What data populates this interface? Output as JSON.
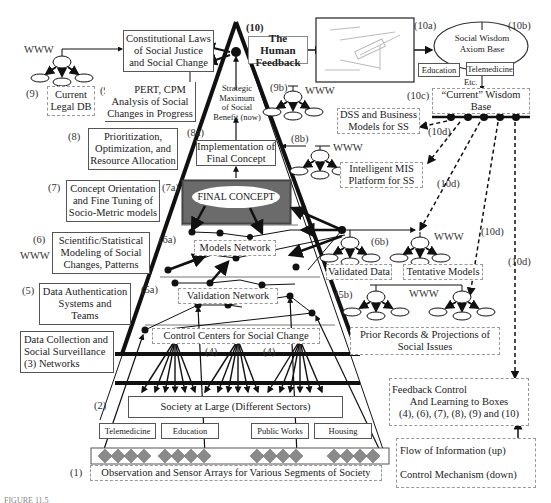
{
  "figure": {
    "caption": "FIGURE 11.5",
    "title": "The Human Feedback"
  },
  "pyramid": {
    "apex_number": "(10)",
    "strategic_maximum": [
      "Strategic",
      "Maximum",
      "of Social",
      "Benefit (now)"
    ],
    "implementation": [
      "Implementation of",
      "Final Concept"
    ],
    "final_concept": "FINAL CONCEPT",
    "models_network": "Models Network",
    "validation_network": "Validation Network",
    "control_centers": "Control Centers for Social Change",
    "society_at_large": "Society at Large (Different Sectors)",
    "sectors": [
      "Telemedicine",
      "Education",
      "Public Works",
      "Housing"
    ],
    "sensor_arrays": "Observation and Sensor Arrays for Various Segments of Society",
    "level_tags": {
      "8a": "(8a)",
      "7a": "(7a)",
      "6a": "(6a)",
      "5a": "(5a)",
      "4a": "(4)",
      "4b": "(4)"
    }
  },
  "left_boxes": {
    "constitutional": [
      "Constitutional Laws",
      "of Social Justice",
      "and Social Change"
    ],
    "pert": {
      "number": "(9a)",
      "lines": [
        "PERT, CPM",
        "Analysis of Social",
        "Changes in Progress"
      ]
    },
    "legal_db": {
      "number": "(9)",
      "lines": [
        "Current",
        "Legal DB"
      ]
    },
    "prioritization": {
      "number": "(8)",
      "lines": [
        "Prioritization,",
        "Optimization, and",
        "Resource Allocation"
      ]
    },
    "concept_orientation": {
      "number": "(7)",
      "lines": [
        "Concept Orientation",
        "and Fine Tuning of",
        "Socio-Metric models"
      ]
    },
    "scientific": {
      "number": "(6)",
      "lines": [
        "Scientific/Statistical",
        "Modeling of Social",
        "Changes, Patterns"
      ]
    },
    "data_authentication": {
      "number": "(5)",
      "lines": [
        "Data Authentication",
        "Systems and",
        "Teams"
      ]
    },
    "data_collection": {
      "number": "(3)",
      "lines": [
        "Data Collection and",
        "Social Surveillance",
        "Networks"
      ]
    },
    "society_number": "(2)",
    "sensor_number": "(1)"
  },
  "right_boxes": {
    "photo_number": "(10a)",
    "wisdom_axiom": {
      "number": "(10b)",
      "lines": [
        "Social Wisdom",
        "Axiom Base"
      ],
      "tags": [
        "Education",
        "Telemedicine",
        "Etc."
      ]
    },
    "current_wisdom": {
      "number": "(10c)",
      "lines": [
        "“Current” Wisdom",
        "Base"
      ]
    },
    "dss": [
      "DSS and Business",
      "Models for SS"
    ],
    "mis": {
      "number": "(8b)",
      "lines": [
        "Intelligent MIS",
        "Platform for SS"
      ]
    },
    "node_9b": "(9b)",
    "validated_data": "Validated Data",
    "tentative_models": "Tentative Models",
    "node_6b": "(6b)",
    "node_5b": "(5b)",
    "prior_records": [
      "Prior Records & Projections of",
      "Social Issues"
    ],
    "feedback_tag": "(10d)",
    "feedback_control": [
      "Feedback Control",
      "And Learning to Boxes",
      "(4), (6), (7), (8), (9) and (10)"
    ]
  },
  "legend": {
    "flow_up": "Flow of Information (up)",
    "control_down": "Control Mechanism (down)"
  },
  "www_label": "WWW",
  "colors": {
    "line": "#111111",
    "diamond": "#8a8a8a",
    "final_concept_frame": "#555555",
    "dotted_border": "#999999"
  }
}
